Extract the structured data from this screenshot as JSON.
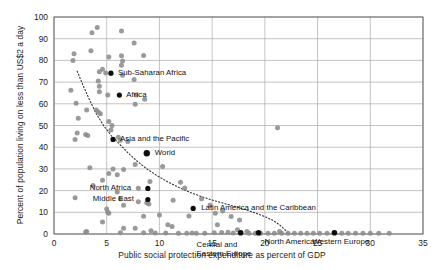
{
  "chart_data": {
    "type": "scatter",
    "title": "",
    "xlabel": "Public social protection expenditure as percent of GDP",
    "ylabel": "Percent of population living on less than US$2 a day",
    "xlim": [
      0,
      35
    ],
    "ylim": [
      0,
      100
    ],
    "xticks": [
      0,
      5,
      10,
      15,
      20,
      25,
      30,
      35
    ],
    "yticks": [
      0,
      10,
      20,
      30,
      40,
      50,
      60,
      70,
      80,
      90,
      100
    ],
    "grid": true,
    "legend": "none",
    "series": [
      {
        "name": "Countries",
        "marker": "circle",
        "color": "#8c8c8c",
        "points": [
          [
            4.1,
            95.2
          ],
          [
            3.6,
            92.7
          ],
          [
            6.4,
            93.6
          ],
          [
            7.6,
            88.0
          ],
          [
            3.5,
            84.4
          ],
          [
            1.9,
            83.1
          ],
          [
            5.2,
            81.6
          ],
          [
            6.4,
            82.2
          ],
          [
            8.5,
            82.3
          ],
          [
            1.8,
            79.9
          ],
          [
            6.5,
            79.7
          ],
          [
            6.4,
            77.8
          ],
          [
            4.6,
            75.9
          ],
          [
            4.3,
            74.8
          ],
          [
            4.9,
            74.2
          ],
          [
            6.5,
            73.1
          ],
          [
            7.6,
            71.2
          ],
          [
            4.2,
            70.5
          ],
          [
            4.3,
            68.1
          ],
          [
            1.6,
            66.3
          ],
          [
            4.3,
            65.5
          ],
          [
            7.8,
            64.1
          ],
          [
            5.1,
            64.0
          ],
          [
            8.6,
            62.1
          ],
          [
            2.1,
            60.2
          ],
          [
            7.7,
            59.8
          ],
          [
            3.1,
            57.1
          ],
          [
            4.0,
            57.2
          ],
          [
            4.2,
            56.2
          ],
          [
            4.4,
            55.4
          ],
          [
            2.3,
            53.3
          ],
          [
            5.2,
            51.9
          ],
          [
            5.5,
            50.0
          ],
          [
            5.4,
            47.9
          ],
          [
            2.2,
            46.5
          ],
          [
            3.0,
            45.9
          ],
          [
            3.2,
            45.4
          ],
          [
            6.1,
            44.6
          ],
          [
            6.3,
            43.2
          ],
          [
            2.0,
            43.6
          ],
          [
            7.0,
            42.6
          ],
          [
            21.2,
            49.0
          ],
          [
            7.7,
            32.0
          ],
          [
            3.4,
            30.5
          ],
          [
            5.6,
            30.0
          ],
          [
            6.6,
            29.7
          ],
          [
            10.3,
            31.1
          ],
          [
            5.2,
            27.9
          ],
          [
            6.0,
            27.3
          ],
          [
            4.6,
            24.8
          ],
          [
            9.1,
            24.2
          ],
          [
            3.7,
            22.4
          ],
          [
            8.0,
            21.1
          ],
          [
            12.0,
            23.9
          ],
          [
            6.0,
            19.3
          ],
          [
            12.4,
            21.2
          ],
          [
            2.0,
            16.7
          ],
          [
            6.3,
            16.3
          ],
          [
            8.0,
            14.9
          ],
          [
            8.8,
            14.4
          ],
          [
            9.0,
            13.8
          ],
          [
            6.6,
            13.2
          ],
          [
            11.3,
            15.6
          ],
          [
            14.0,
            16.2
          ],
          [
            5.0,
            11.5
          ],
          [
            5.1,
            10.0
          ],
          [
            5.2,
            9.6
          ],
          [
            8.5,
            8.2
          ],
          [
            10.0,
            8.7
          ],
          [
            12.8,
            8.3
          ],
          [
            15.3,
            9.6
          ],
          [
            16.0,
            10.6
          ],
          [
            4.6,
            5.5
          ],
          [
            10.8,
            4.3
          ],
          [
            11.2,
            3.4
          ],
          [
            6.6,
            2.7
          ],
          [
            7.7,
            2.6
          ],
          [
            9.2,
            1.5
          ],
          [
            3.1,
            1.2
          ],
          [
            3.0,
            0.9
          ],
          [
            6.3,
            0.6
          ],
          [
            8.5,
            0.6
          ],
          [
            9.6,
            0.5
          ],
          [
            10.6,
            0.5
          ],
          [
            11.8,
            0.4
          ],
          [
            12.6,
            0.4
          ],
          [
            13.5,
            0.4
          ],
          [
            14.3,
            0.4
          ],
          [
            15.2,
            0.6
          ],
          [
            15.9,
            0.7
          ],
          [
            16.5,
            0.8
          ],
          [
            17.0,
            0.5
          ],
          [
            18.5,
            0.4
          ],
          [
            19.1,
            0.4
          ],
          [
            19.6,
            0.4
          ],
          [
            20.3,
            0.4
          ],
          [
            20.9,
            0.4
          ],
          [
            21.4,
            1.2
          ],
          [
            21.6,
            0.4
          ],
          [
            22.2,
            0.4
          ],
          [
            22.8,
            0.4
          ],
          [
            23.4,
            0.4
          ],
          [
            24.0,
            0.4
          ],
          [
            24.6,
            0.4
          ],
          [
            25.2,
            0.4
          ],
          [
            25.9,
            0.4
          ],
          [
            27.3,
            0.4
          ],
          [
            27.9,
            0.4
          ],
          [
            28.6,
            0.4
          ],
          [
            29.3,
            0.4
          ],
          [
            30.0,
            0.4
          ],
          [
            30.8,
            0.4
          ],
          [
            31.8,
            0.4
          ],
          [
            16.8,
            8.1
          ],
          [
            17.6,
            6.5
          ],
          [
            14.8,
            13.2
          ],
          [
            17.4,
            2.0
          ],
          [
            18.3,
            1.2
          ],
          [
            13.1,
            0.5
          ],
          [
            15.5,
            4.3
          ]
        ]
      },
      {
        "name": "Aggregates",
        "marker": "circle-filled",
        "color": "#000000",
        "points": [
          {
            "x": 5.4,
            "y": 74.1,
            "label": "Sub-Saharan Africa",
            "size": 5.2,
            "label_dx": 7,
            "label_dy": -0.5
          },
          {
            "x": 6.2,
            "y": 64.0,
            "label": "Africa",
            "size": 5.2,
            "label_dx": 7,
            "label_dy": -0.5
          },
          {
            "x": 5.6,
            "y": 43.6,
            "label": "Asia and the Pacific",
            "size": 5.2,
            "label_dx": 7,
            "label_dy": -0.5
          },
          {
            "x": 8.8,
            "y": 37.2,
            "label": "World",
            "size": 6.4,
            "label_dx": 8,
            "label_dy": -0.5
          },
          {
            "x": 8.9,
            "y": 21.0,
            "label": "North Africa",
            "size": 5.2,
            "label_dx": -58,
            "label_dy": -0.5
          },
          {
            "x": 8.9,
            "y": 15.9,
            "label": "Middle East",
            "size": 5.2,
            "label_dx": -55,
            "label_dy": -0.5
          },
          {
            "x": 13.2,
            "y": 11.8,
            "label": "Latin America and the Caribbean",
            "size": 5.2,
            "label_dx": 8,
            "label_dy": -0.5
          },
          {
            "x": 17.7,
            "y": 0.6,
            "label": "Central and\nEastern Europe",
            "size": 5.6,
            "label_dx": -44,
            "label_dy": 12
          },
          {
            "x": 19.4,
            "y": 0.6,
            "label": "North America",
            "size": 5.6,
            "label_dx": 6,
            "label_dy": 9
          },
          {
            "x": 26.6,
            "y": 0.6,
            "label": "Western Europe",
            "size": 5.6,
            "label_dx": -22,
            "label_dy": 9
          }
        ]
      }
    ],
    "trendline": {
      "style": "dotted",
      "color": "#333333",
      "points": [
        [
          2.2,
          75.0
        ],
        [
          2.8,
          68.0
        ],
        [
          3.4,
          61.5
        ],
        [
          4.0,
          55.5
        ],
        [
          4.7,
          50.0
        ],
        [
          5.4,
          45.5
        ],
        [
          6.2,
          41.5
        ],
        [
          7.0,
          37.5
        ],
        [
          7.9,
          33.5
        ],
        [
          8.8,
          30.0
        ],
        [
          9.8,
          26.8
        ],
        [
          10.8,
          24.0
        ],
        [
          11.8,
          21.5
        ],
        [
          12.9,
          19.2
        ],
        [
          14.0,
          17.2
        ],
        [
          15.1,
          15.5
        ],
        [
          16.2,
          14.0
        ],
        [
          17.3,
          12.5
        ],
        [
          18.3,
          11.0
        ],
        [
          19.2,
          9.5
        ],
        [
          20.0,
          8.0
        ],
        [
          20.8,
          6.2
        ],
        [
          21.4,
          4.2
        ],
        [
          21.9,
          2.0
        ],
        [
          22.2,
          0.4
        ]
      ]
    }
  },
  "colors": {
    "point_gray": "#8c8c8c",
    "point_black": "#0d0d0d",
    "grid": "#a9a9a9",
    "frame": "#6e6e6e",
    "text": "#1a1a1a"
  }
}
